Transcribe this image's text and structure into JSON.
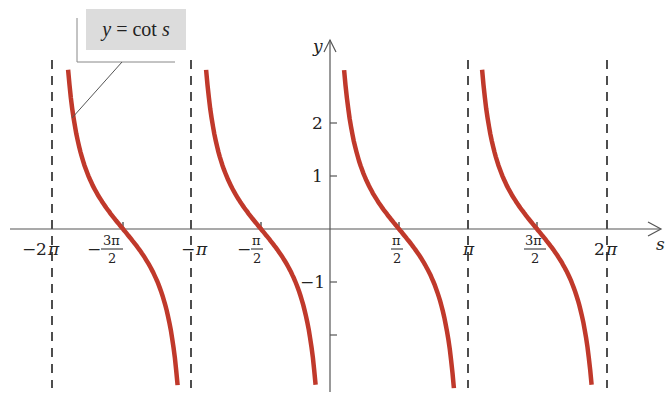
{
  "chart_data": {
    "type": "line",
    "title": "",
    "function_label": "y = cot s",
    "function_label_parts": {
      "lhs": "y",
      "eq": " = ",
      "fn": "cot ",
      "var": "s"
    },
    "xlabel": "s",
    "ylabel": "y",
    "xlim": [
      -6.6,
      7.3
    ],
    "ylim": [
      -3.1,
      3.5
    ],
    "x_ticks": [
      {
        "value": -6.2832,
        "label": "-2π"
      },
      {
        "value": -4.7124,
        "label": "-3π/2"
      },
      {
        "value": -3.1416,
        "label": "-π"
      },
      {
        "value": -1.5708,
        "label": "-π/2"
      },
      {
        "value": 1.5708,
        "label": "π/2"
      },
      {
        "value": 3.1416,
        "label": "π"
      },
      {
        "value": 4.7124,
        "label": "3π/2"
      },
      {
        "value": 6.2832,
        "label": "2π"
      }
    ],
    "y_ticks": [
      {
        "value": 2,
        "label": "2"
      },
      {
        "value": 1,
        "label": "1"
      },
      {
        "value": -1,
        "label": "-1"
      },
      {
        "value": -2,
        "label": ""
      }
    ],
    "asymptotes": [
      -6.2832,
      -3.1416,
      3.1416,
      6.2832
    ],
    "series": [
      {
        "name": "y = cot s",
        "color": "#c0392b",
        "function": "cot(s)",
        "branches": [
          {
            "domain": [
              -5.962,
              -3.469
            ]
          },
          {
            "domain": [
              -2.82,
              -0.328
            ]
          },
          {
            "domain": [
              0.322,
              2.82
            ]
          },
          {
            "domain": [
              3.463,
              5.955
            ]
          }
        ]
      }
    ],
    "zeros": [
      -4.7124,
      -1.5708,
      1.5708,
      4.7124
    ],
    "grid": false,
    "legend": "callout box top-left"
  },
  "labels": {
    "x_axis": "s",
    "y_axis": "y",
    "tick_neg2pi": {
      "sign": "−",
      "num": "2",
      "pi": "π"
    },
    "tick_neg3pi2": {
      "sign": "−",
      "num": "3π",
      "den": "2"
    },
    "tick_negpi": {
      "sign": "−",
      "pi": "π"
    },
    "tick_negpi2": {
      "sign": "−",
      "num": "π",
      "den": "2"
    },
    "tick_pi2": {
      "num": "π",
      "den": "2"
    },
    "tick_pi": {
      "pi": "π"
    },
    "tick_3pi2": {
      "num": "3π",
      "den": "2"
    },
    "tick_2pi": {
      "num": "2",
      "pi": "π"
    },
    "y_2": "2",
    "y_1": "1",
    "y_neg1": "−1"
  },
  "colors": {
    "curve": "#c0392b",
    "axis": "#555555",
    "asymptote": "#222222",
    "label_bg": "#dcdcdc"
  }
}
